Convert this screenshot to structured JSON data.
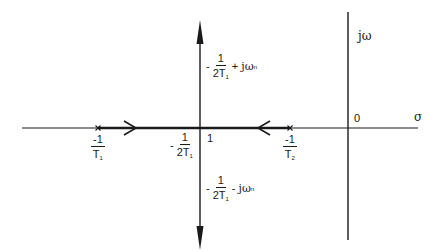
{
  "diagram": {
    "type": "root-locus",
    "axes": {
      "real_axis_label": "σ",
      "imag_axis_label": "jω",
      "origin_label": "0"
    },
    "poles": [
      {
        "id": "pole-1",
        "marker": "x",
        "label_numerator": "-1",
        "label_denominator": "T",
        "label_subscript": "1"
      },
      {
        "id": "pole-2",
        "marker": "x",
        "label_numerator": "-1",
        "label_denominator": "T",
        "label_subscript": "2"
      }
    ],
    "breakaway": {
      "prefix": "-",
      "numerator": "1",
      "denominator": "2T",
      "subscript": "1",
      "right_label": "1"
    },
    "upper_branch": {
      "prefix": "-",
      "numerator": "1",
      "denominator": "2T",
      "subscript": "1",
      "operator": "+",
      "suffix": "jω",
      "suffix_subscript": "n"
    },
    "lower_branch": {
      "prefix": "-",
      "numerator": "1",
      "denominator": "2T",
      "subscript": "1",
      "operator": "-",
      "suffix": "jω",
      "suffix_subscript": "n"
    },
    "colors": {
      "line": "#1a1a1a",
      "background": "#ffffff"
    }
  }
}
